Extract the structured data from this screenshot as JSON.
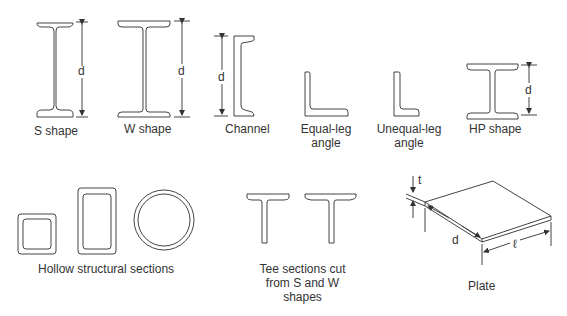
{
  "shapes": {
    "s_shape": {
      "label": "S shape",
      "dim": "d"
    },
    "w_shape": {
      "label": "W shape",
      "dim": "d"
    },
    "channel": {
      "label": "Channel",
      "dim": "d"
    },
    "equal_leg_angle": {
      "label": "Equal-leg angle"
    },
    "unequal_leg_angle": {
      "label": "Unequal-leg angle"
    },
    "hp_shape": {
      "label": "HP shape",
      "dim": "d"
    },
    "hollow": {
      "label": "Hollow structural sections"
    },
    "tee": {
      "label": "Tee sections cut from S and W shapes"
    },
    "plate": {
      "label": "Plate",
      "dim_t": "t",
      "dim_d": "d",
      "dim_l": "ℓ"
    }
  },
  "colors": {
    "stroke": "#444444",
    "text": "#333333"
  }
}
